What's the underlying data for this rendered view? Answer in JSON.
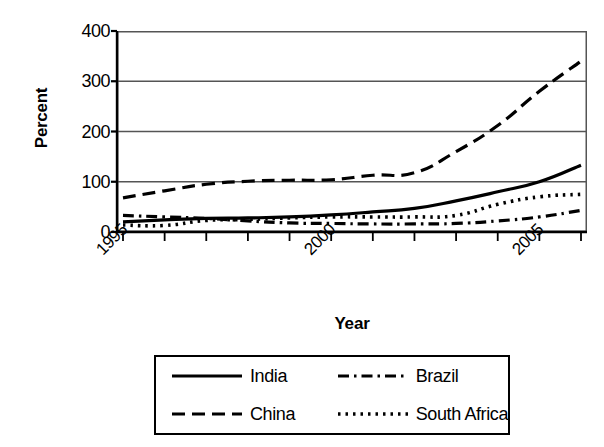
{
  "chart_data": {
    "type": "line",
    "title": "",
    "xlabel": "Year",
    "ylabel": "Percent",
    "xlim": [
      1995,
      2006
    ],
    "ylim": [
      0,
      400
    ],
    "grid": true,
    "legend_position": "bottom",
    "x": [
      1995,
      1996,
      1997,
      1998,
      1999,
      2000,
      2001,
      2002,
      2003,
      2004,
      2005,
      2006
    ],
    "x_tick_labels": [
      "1995",
      "2000",
      "2005"
    ],
    "x_tick_label_values": [
      1995,
      2000,
      2005
    ],
    "y_tick_labels": [
      "0",
      "100",
      "200",
      "300",
      "400"
    ],
    "y_tick_values": [
      0,
      100,
      200,
      300,
      400
    ],
    "series": [
      {
        "name": "India",
        "style": "solid",
        "color": "#000000",
        "values": [
          20,
          24,
          27,
          28,
          30,
          34,
          40,
          47,
          62,
          80,
          100,
          133
        ]
      },
      {
        "name": "China",
        "style": "dashed",
        "color": "#000000",
        "values": [
          68,
          82,
          95,
          101,
          103,
          104,
          113,
          118,
          160,
          212,
          280,
          340
        ]
      },
      {
        "name": "Brazil",
        "style": "dash-dot",
        "color": "#000000",
        "values": [
          33,
          30,
          27,
          22,
          18,
          17,
          16,
          16,
          17,
          22,
          30,
          43
        ]
      },
      {
        "name": "South Africa",
        "style": "dotted",
        "color": "#000000",
        "values": [
          14,
          13,
          23,
          25,
          28,
          30,
          30,
          30,
          33,
          55,
          70,
          75
        ]
      }
    ]
  },
  "axes": {
    "y_title": "Percent",
    "x_title": "Year",
    "y_ticks": [
      "400",
      "300",
      "200",
      "100",
      "0"
    ],
    "x_ticks": [
      "1995",
      "2000",
      "2005"
    ]
  },
  "legend": {
    "entries": [
      {
        "label": "India",
        "style": "solid"
      },
      {
        "label": "Brazil",
        "style": "dash-dot"
      },
      {
        "label": "China",
        "style": "dashed"
      },
      {
        "label": "South Africa",
        "style": "dotted"
      }
    ]
  },
  "colors": {
    "ink": "#000000",
    "grid": "#555555",
    "background": "#ffffff"
  }
}
